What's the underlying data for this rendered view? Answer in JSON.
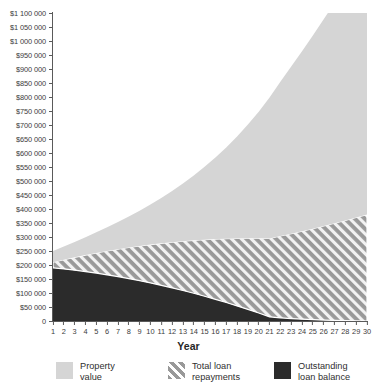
{
  "chart_data": {
    "type": "area",
    "stacked": true,
    "title": "",
    "subtitle": "",
    "xlabel": "Year",
    "ylabel": "",
    "grid": false,
    "legend_position": "bottom",
    "x": [
      1,
      2,
      3,
      4,
      5,
      6,
      7,
      8,
      9,
      10,
      11,
      12,
      13,
      14,
      15,
      16,
      17,
      18,
      19,
      20,
      21,
      22,
      23,
      24,
      25,
      26,
      27,
      28,
      29,
      30
    ],
    "xlim": [
      1,
      30
    ],
    "ylim": [
      0,
      1100000
    ],
    "y_tick_step": 50000,
    "y_tick_labels": [
      "$1 100 000",
      "$1 050 000",
      "$1 000 000",
      "$950 000",
      "$900 000",
      "$850 000",
      "$800 000",
      "$750 000",
      "$700 000",
      "$650 000",
      "$600 000",
      "$550 000",
      "$500 000",
      "$450 000",
      "$400 000",
      "$350 000",
      "$300 000",
      "$250 000",
      "$200 000",
      "$150 000",
      "$100 000",
      "$50 000",
      "0"
    ],
    "y_tick_values": [
      1100000,
      1050000,
      1000000,
      950000,
      900000,
      850000,
      800000,
      750000,
      700000,
      650000,
      600000,
      550000,
      500000,
      450000,
      400000,
      350000,
      300000,
      250000,
      200000,
      150000,
      100000,
      50000,
      0
    ],
    "x_tick_labels": [
      "1",
      "2",
      "3",
      "4",
      "5",
      "6",
      "7",
      "8",
      "9",
      "10",
      "11",
      "12",
      "13",
      "14",
      "15",
      "16",
      "17",
      "18",
      "19",
      "20",
      "21",
      "22",
      "23",
      "24",
      "25",
      "26",
      "27",
      "28",
      "29",
      "30"
    ],
    "series": [
      {
        "name": "Outstanding loan balance",
        "legend_label": "Outstanding\nloan balance",
        "fill": "#2b2b2b",
        "pattern": "solid",
        "stack_order": 0,
        "values": [
          190000,
          186000,
          181500,
          176500,
          171000,
          165000,
          158500,
          151500,
          144000,
          136000,
          127500,
          118500,
          109000,
          99000,
          88500,
          77500,
          66000,
          54000,
          41500,
          28500,
          15000,
          11500,
          8800,
          6600,
          4800,
          3400,
          2200,
          1300,
          600,
          0
        ]
      },
      {
        "name": "Total loan repayments",
        "legend_label": "Total loan\nrepayments",
        "fill": "#999999",
        "pattern": "diagonal-hatch",
        "stack_order": 1,
        "values": [
          20000,
          33000,
          46000,
          59000,
          72000,
          85000,
          98000,
          111000,
          124000,
          137000,
          150000,
          163000,
          176000,
          189000,
          202000,
          215000,
          228000,
          241000,
          254000,
          267000,
          280000,
          292000,
          303000,
          314000,
          325000,
          336000,
          347000,
          358000,
          369000,
          380000
        ]
      },
      {
        "name": "Property value",
        "legend_label": "Property\nvalue",
        "fill": "#d5d5d5",
        "pattern": "solid",
        "stack_order": 2,
        "values": [
          40000,
          47000,
          55000,
          64000,
          74000,
          85000,
          97000,
          111000,
          126000,
          143000,
          162000,
          183000,
          206000,
          232000,
          260000,
          291000,
          326000,
          364000,
          406000,
          452000,
          503000,
          551000,
          597000,
          643000,
          690000,
          738000,
          787000,
          837000,
          889000,
          940000
        ]
      }
    ],
    "stack_totals": [
      250000,
      266000,
      282500,
      299500,
      317000,
      335000,
      353500,
      373500,
      394000,
      416000,
      439500,
      464500,
      491000,
      520000,
      550500,
      583500,
      620000,
      659000,
      701500,
      747500,
      798000,
      854500,
      908800,
      963600,
      1019800,
      1077400,
      1136200,
      1196300,
      1258600,
      1320000
    ],
    "colors": {
      "property_value": "#d5d5d5",
      "total_loan_repayments": "#999999",
      "outstanding_loan_balance": "#2b2b2b",
      "axis": "#5a5a5a",
      "text": "#3c3c3c",
      "background": "#ffffff"
    }
  },
  "legend": {
    "items": [
      {
        "label": "Property\nvalue",
        "swatch": "property-value-swatch"
      },
      {
        "label": "Total loan\nrepayments",
        "swatch": "total-loan-repayments-swatch"
      },
      {
        "label": "Outstanding\nloan balance",
        "swatch": "outstanding-loan-balance-swatch"
      }
    ]
  },
  "axes": {
    "x_title": "Year"
  }
}
